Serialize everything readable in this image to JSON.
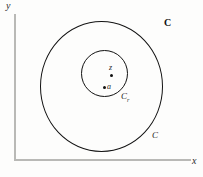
{
  "figure": {
    "axes": {
      "y_label": "y",
      "x_label": "x"
    },
    "plane_label": "C",
    "curves": [
      {
        "name": "outer-circle",
        "label": "C"
      },
      {
        "name": "inner-circle",
        "label_base": "C",
        "label_sub": "r"
      }
    ],
    "points": [
      {
        "name": "z",
        "label": "z"
      },
      {
        "name": "a",
        "label": "a"
      }
    ]
  }
}
